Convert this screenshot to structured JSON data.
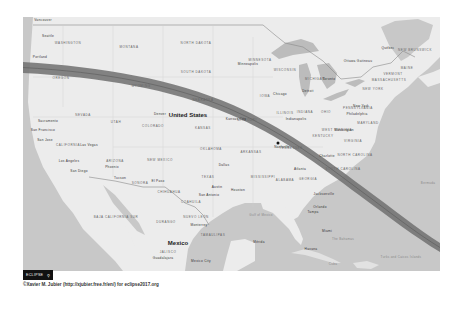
{
  "map": {
    "title": "2017 Total Solar Eclipse Path over North America",
    "colors": {
      "land": "#ececec",
      "water": "#c8c8c8",
      "border": "#8a8a8a",
      "eclipse_path": "#6e6e6e",
      "eclipse_centerline": "#555555"
    },
    "eclipse_path": {
      "label": "Path of totality",
      "entry": "Oregon coast",
      "exit": "South Carolina / Atlantic"
    },
    "countries": {
      "usa": "United States",
      "mexico": "Mexico"
    },
    "states": {
      "washington": "WASHINGTON",
      "oregon": "OREGON",
      "montana": "MONTANA",
      "north_dakota": "NORTH DAKOTA",
      "south_dakota": "SOUTH DAKOTA",
      "wyoming": "WYOMING",
      "nebraska": "NEBRASKA",
      "nevada": "NEVADA",
      "utah": "UTAH",
      "colorado": "COLORADO",
      "kansas": "KANSAS",
      "california": "CALIFORNIA",
      "arizona": "ARIZONA",
      "new_mexico": "NEW MEXICO",
      "oklahoma": "OKLAHOMA",
      "texas": "TEXAS",
      "minnesota": "MINNESOTA",
      "wisconsin": "WISCONSIN",
      "michigan": "MICHIGAN",
      "iowa": "IOWA",
      "illinois": "ILLINOIS",
      "indiana": "INDIANA",
      "ohio": "OHIO",
      "missouri": "MISSOURI",
      "kentucky": "KENTUCKY",
      "tennessee": "TENNESSEE",
      "arkansas": "ARKANSAS",
      "mississippi": "MISSISSIPPI",
      "alabama": "ALABAMA",
      "georgia": "GEORGIA",
      "pennsylvania": "PENNSYLVANIA",
      "new_york": "NEW YORK",
      "virginia": "VIRGINIA",
      "west_virginia": "WEST VIRGINIA",
      "north_carolina": "NORTH CAROLINA",
      "south_carolina": "SOUTH CAROLINA",
      "maine": "MAINE",
      "vermont": "VERMONT",
      "new_hampshire": "NEW HAMPSHIRE",
      "massachusetts": "MASSACHUSETTS",
      "maryland": "MARYLAND",
      "nuevo_leon": "NUEVO LEÓN",
      "chihuahua": "CHIHUAHUA",
      "sonora": "SONORA",
      "coahuila": "COAHUILA",
      "durango": "DURANGO",
      "baja_california_sur": "BAJA CALIFORNIA SUR",
      "tamaulipas": "TAMAULIPAS",
      "jalisco": "JALISCO",
      "new_brunswick": "NEW BRUNSWICK",
      "quebec": "QUÉBEC"
    },
    "cities": {
      "vancouver": "Vancouver",
      "seattle": "Seattle",
      "portland": "Portland",
      "sacramento": "Sacramento",
      "san_francisco": "San Francisco",
      "san_jose": "San Jose",
      "los_angeles": "Los Angeles",
      "san_diego": "San Diego",
      "las_vegas": "Las Vegas",
      "phoenix": "Phoenix",
      "tucson": "Tucson",
      "el_paso": "El Paso",
      "denver": "Denver",
      "kansas_city": "Kansas City",
      "dallas": "Dallas",
      "austin": "Austin",
      "san_antonio": "San Antonio",
      "houston": "Houston",
      "minneapolis": "Minneapolis",
      "chicago": "Chicago",
      "detroit": "Detroit",
      "indianapolis": "Indianapolis",
      "nashville": "Nashville",
      "atlanta": "Atlanta",
      "charlotte": "Charlotte",
      "washington": "Washington",
      "philadelphia": "Philadelphia",
      "new_york": "New York",
      "toronto": "Toronto",
      "ottawa": "Ottawa Gatineau",
      "quebec_city": "Québec",
      "jacksonville": "Jacksonville",
      "tampa": "Tampa",
      "orlando": "Orlando",
      "miami": "Miami",
      "havana": "Havana",
      "monterrey": "Monterrey",
      "mexico_city": "Mexico City",
      "merida": "Mérida",
      "guadalajara": "Guadalajara"
    },
    "water": {
      "gulf": "Gulf of Mexico",
      "bermuda": "Bermuda",
      "bahamas": "The Bahamas",
      "cuba": "Cuba",
      "turks": "Turks and Caicos Islands",
      "cayman": "Cayman Islands",
      "haiti": "Haiti",
      "dominican": "Dominican Republic",
      "puerto_rico": "Puerto Rico"
    },
    "marker": {
      "label": "Nashville",
      "type": "point-of-interest"
    }
  },
  "overlay": {
    "badge_label": "ECLIPSE",
    "badge_icon": "search-icon",
    "badge_icon_glyph": "⚲",
    "credit": "©Xavier M. Jubier (http://xjubier.free.fr/en/) for eclipse2017.org",
    "attribution": "Leaflet | Map data ©"
  }
}
